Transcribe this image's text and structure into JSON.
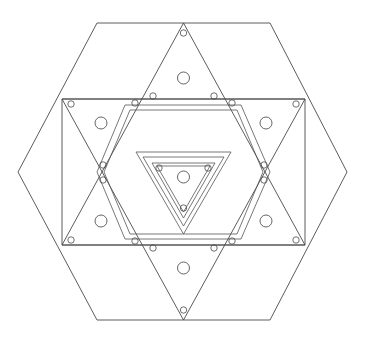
{
  "figure": {
    "kind": "line-diagram",
    "background_color": "#ffffff",
    "stroke_color": "#4a4a4a",
    "canvas": {
      "width": 369,
      "height": 343
    },
    "center": {
      "x": 183.5,
      "y": 172
    }
  },
  "shapes": {
    "outer_hexagon": {
      "name": "outer-hexagon",
      "points": "97,23 270,23 347,172 270,320 97,320 18,172"
    },
    "rectangle": {
      "name": "central-rectangle",
      "points": "62,99 305,99 305,245 62,245"
    },
    "star_triangle_up": {
      "name": "hexagram-triangle-up",
      "points": "183.5,320 62,99 305,99"
    },
    "star_triangle_down": {
      "name": "hexagram-triangle-down",
      "points": "183.5,23 305,245 62,245"
    },
    "inner_hexagon_outer_ring": {
      "name": "inner-hexagon-outer-ring",
      "points": "125,105 241,105 270,172 241,239 125,239 97,172"
    },
    "inner_hexagon_inner_ring": {
      "name": "inner-hexagon-inner-ring",
      "points": "130,110 237,110 263,172 237,234 130,234 104,172"
    },
    "core_triangle_outer": {
      "name": "core-triangle-outer",
      "points": "136,152 231,152 183.5,234"
    },
    "core_triangle_mid": {
      "name": "core-triangle-mid",
      "points": "143,157 224,157 183.5,226"
    },
    "core_triangle_inner_outer": {
      "name": "core-triangle-inner-outer",
      "points": "152,163 215,163 183.5,218"
    },
    "core_triangle_inner_inner": {
      "name": "core-triangle-inner-inner",
      "points": "157,166 210,166 183.5,212"
    }
  },
  "holes": {
    "label": "large-bolt-holes",
    "radius": 6,
    "positions": [
      {
        "name": "hole-top",
        "x": 183.5,
        "y": 78
      },
      {
        "name": "hole-bottom",
        "x": 183.5,
        "y": 268
      },
      {
        "name": "hole-upper-left",
        "x": 101,
        "y": 123
      },
      {
        "name": "hole-upper-right",
        "x": 266,
        "y": 123
      },
      {
        "name": "hole-lower-left",
        "x": 101,
        "y": 221
      },
      {
        "name": "hole-lower-right",
        "x": 266,
        "y": 221
      },
      {
        "name": "hole-center",
        "x": 183.5,
        "y": 177
      }
    ]
  },
  "pins": {
    "label": "small-pin-holes",
    "radius": 3.2,
    "positions": [
      {
        "name": "pin-apex-top",
        "x": 183.5,
        "y": 33
      },
      {
        "name": "pin-apex-bottom",
        "x": 183.5,
        "y": 310
      },
      {
        "name": "pin-rect-tl",
        "x": 71,
        "y": 104
      },
      {
        "name": "pin-rect-tr",
        "x": 296,
        "y": 104
      },
      {
        "name": "pin-rect-bl",
        "x": 71,
        "y": 240
      },
      {
        "name": "pin-rect-br",
        "x": 296,
        "y": 240
      },
      {
        "name": "pin-hex-top-left-inner",
        "x": 135,
        "y": 103
      },
      {
        "name": "pin-hex-top-left-outer",
        "x": 153,
        "y": 96
      },
      {
        "name": "pin-hex-top-right-inner",
        "x": 232,
        "y": 103
      },
      {
        "name": "pin-hex-top-right-outer",
        "x": 214,
        "y": 96
      },
      {
        "name": "pin-hex-bottom-left-inner",
        "x": 135,
        "y": 241
      },
      {
        "name": "pin-hex-bottom-left-outer",
        "x": 153,
        "y": 248
      },
      {
        "name": "pin-hex-bottom-right-inner",
        "x": 232,
        "y": 241
      },
      {
        "name": "pin-hex-bottom-right-outer",
        "x": 214,
        "y": 248
      },
      {
        "name": "pin-left-upper",
        "x": 103,
        "y": 165
      },
      {
        "name": "pin-left-lower",
        "x": 103,
        "y": 180
      },
      {
        "name": "pin-right-upper",
        "x": 264,
        "y": 165
      },
      {
        "name": "pin-right-lower",
        "x": 264,
        "y": 180
      },
      {
        "name": "pin-core-left",
        "x": 159,
        "y": 168
      },
      {
        "name": "pin-core-right",
        "x": 208,
        "y": 168
      },
      {
        "name": "pin-core-bottom",
        "x": 183.5,
        "y": 208
      }
    ]
  }
}
